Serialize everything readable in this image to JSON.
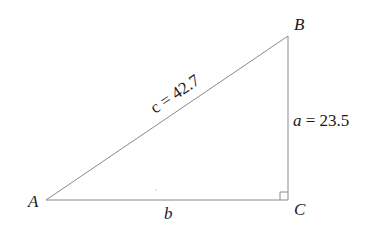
{
  "diagram": {
    "type": "right-triangle",
    "vertices": {
      "A": {
        "label": "A"
      },
      "B": {
        "label": "B"
      },
      "C": {
        "label": "C"
      }
    },
    "sides": {
      "hypotenuse": {
        "label": "c = 42.7"
      },
      "vertical": {
        "var": "a",
        "eq": " = 23.5"
      },
      "base": {
        "label": "b"
      }
    },
    "right_angle_at": "C",
    "colors": {
      "line": "#8a8a8a",
      "text": "#1a1a1a"
    }
  }
}
